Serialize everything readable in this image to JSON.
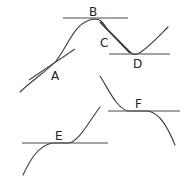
{
  "diagram": {
    "type": "tangent-lines-on-curves",
    "stroke_color": "#3a3a3a",
    "background": "#ffffff",
    "points": [
      {
        "id": "A",
        "label": "A",
        "description": "inflection-like point on rising part of curve, tangent sloped upward"
      },
      {
        "id": "B",
        "label": "B",
        "description": "local maximum, horizontal tangent"
      },
      {
        "id": "C",
        "label": "C",
        "description": "steep decreasing section, tangent coincides with curve"
      },
      {
        "id": "D",
        "label": "D",
        "description": "local minimum, horizontal tangent"
      },
      {
        "id": "E",
        "label": "E",
        "description": "horizontal point of inflection on increasing curve"
      },
      {
        "id": "F",
        "label": "F",
        "description": "horizontal point of inflection on decreasing curve"
      }
    ]
  }
}
